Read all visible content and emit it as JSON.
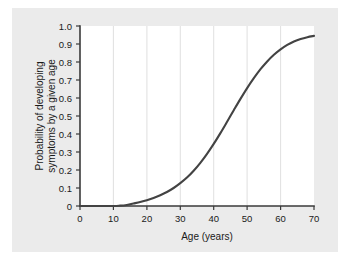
{
  "figure": {
    "background_color": "#ebebeb",
    "plot_background_color": "#ffffff",
    "curve_color": "#434343",
    "axis_color": "#3a3a3a",
    "grid_color": "#d8d8d8"
  },
  "chart_data": {
    "type": "line",
    "title": "",
    "subtitle": "",
    "xlabel": "Age (years)",
    "ylabel": "Probability of developing symptoms by a given age",
    "ylabel_lines": [
      "Probability of developing",
      "symptoms by a given age"
    ],
    "xlim": [
      0,
      70
    ],
    "ylim": [
      0,
      1.0
    ],
    "xticks": [
      0,
      10,
      20,
      30,
      40,
      50,
      60,
      70
    ],
    "xticklabels": [
      "0",
      "10",
      "20",
      "30",
      "40",
      "50",
      "60",
      "70"
    ],
    "yticks": [
      0,
      0.1,
      0.2,
      0.3,
      0.4,
      0.5,
      0.6,
      0.7,
      0.8,
      0.9,
      1.0
    ],
    "yticklabels": [
      "0",
      "0.1",
      "0.2",
      "0.3",
      "0.4",
      "0.5",
      "0.6",
      "0.7",
      "0.8",
      "0.9",
      "1.0"
    ],
    "grid": "vertical-major",
    "legend": "none",
    "series": [
      {
        "name": "Cumulative probability of symptom onset",
        "x": [
          0,
          5,
          10,
          12,
          14,
          15,
          16,
          18,
          20,
          22,
          24,
          26,
          28,
          30,
          32,
          34,
          36,
          38,
          40,
          42,
          44,
          46,
          48,
          50,
          52,
          54,
          56,
          58,
          60,
          62,
          64,
          66,
          68,
          70
        ],
        "values": [
          0.0,
          0.0,
          0.0,
          0.002,
          0.006,
          0.01,
          0.014,
          0.022,
          0.032,
          0.045,
          0.06,
          0.078,
          0.1,
          0.127,
          0.158,
          0.196,
          0.24,
          0.29,
          0.345,
          0.405,
          0.468,
          0.532,
          0.595,
          0.655,
          0.71,
          0.76,
          0.803,
          0.84,
          0.87,
          0.895,
          0.914,
          0.928,
          0.938,
          0.945
        ]
      }
    ],
    "annotations": []
  }
}
